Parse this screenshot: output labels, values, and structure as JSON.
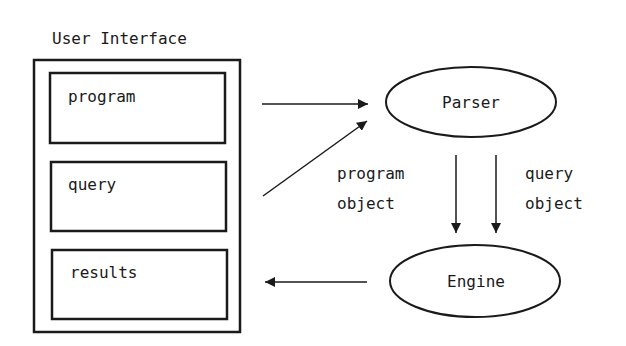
{
  "diagram": {
    "user_interface": {
      "title": "User Interface",
      "panels": [
        {
          "label": "program"
        },
        {
          "label": "query"
        },
        {
          "label": "results"
        }
      ]
    },
    "nodes": {
      "parser": {
        "label": "Parser"
      },
      "engine": {
        "label": "Engine"
      }
    },
    "edge_labels": {
      "program_object": [
        "program",
        "object"
      ],
      "query_object": [
        "query",
        "object"
      ]
    },
    "edges": [
      {
        "from": "program",
        "to": "Parser"
      },
      {
        "from": "query",
        "to": "Parser"
      },
      {
        "from": "Parser",
        "to": "Engine",
        "label": "program object"
      },
      {
        "from": "Parser",
        "to": "Engine",
        "label": "query object"
      },
      {
        "from": "Engine",
        "to": "results"
      }
    ],
    "colors": {
      "stroke": "#1a1a1a",
      "background": "#ffffff"
    }
  }
}
